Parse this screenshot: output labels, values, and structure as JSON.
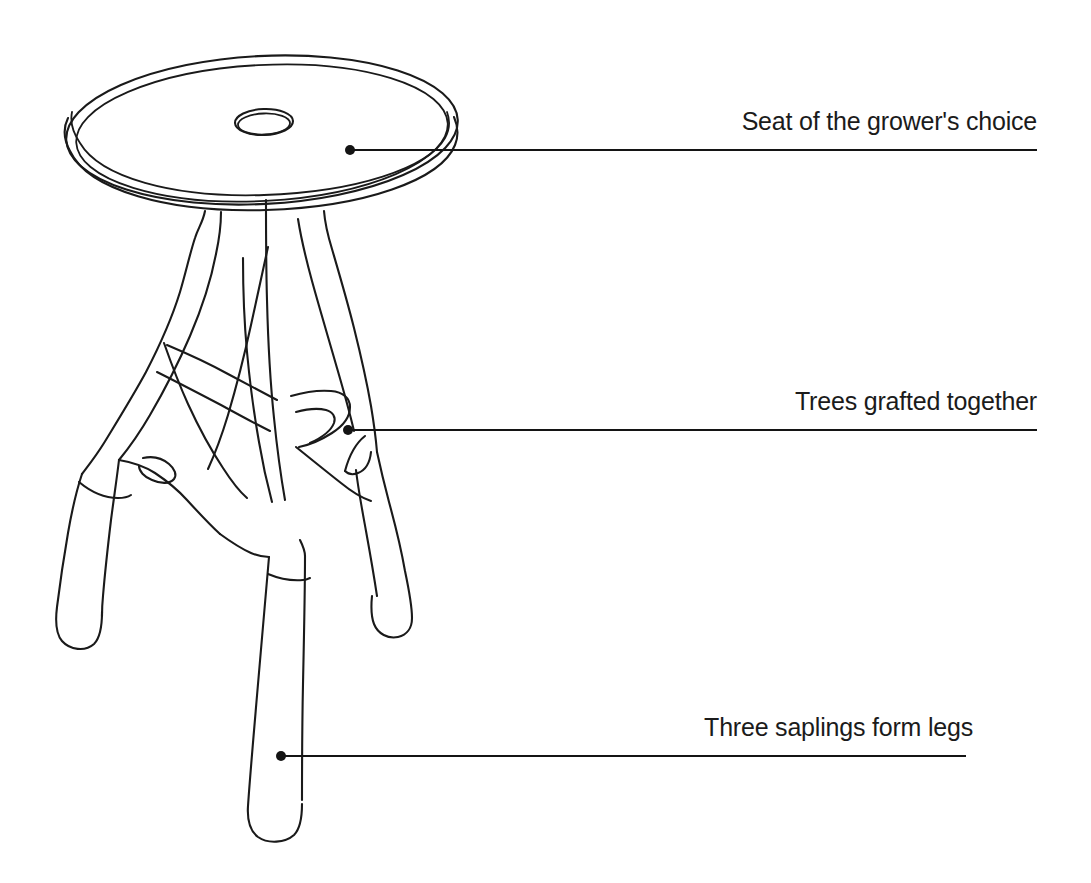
{
  "figure": {
    "background_color": "#ffffff",
    "ink_color": "#1a1a1a",
    "width": 1091,
    "height": 883
  },
  "callouts": [
    {
      "id": "seat",
      "label": "Seat of the grower's choice",
      "dot": {
        "x": 350,
        "y": 150
      },
      "line_end": {
        "x": 1037,
        "y": 150
      },
      "underline_y": 150
    },
    {
      "id": "graft",
      "label": "Trees grafted together",
      "dot": {
        "x": 348,
        "y": 430
      },
      "line_end": {
        "x": 1037,
        "y": 430
      },
      "underline_y": 430
    },
    {
      "id": "legs",
      "label": "Three saplings form legs",
      "dot": {
        "x": 281,
        "y": 756
      },
      "line_end": {
        "x": 966,
        "y": 756
      },
      "underline_y": 756
    }
  ],
  "parts": {
    "seat": {
      "name": "round seat disc",
      "center": {
        "x": 262,
        "y": 130
      },
      "radius_x": 196,
      "radius_y": 76,
      "hole": {
        "cx": 264,
        "cy": 122,
        "rx": 29,
        "ry": 13
      }
    },
    "trunk": {
      "name": "grafted trunk column"
    },
    "legs": [
      {
        "name": "left leg",
        "foot_y": 645
      },
      {
        "name": "front leg",
        "foot_y": 840
      },
      {
        "name": "right leg",
        "foot_y": 633
      }
    ]
  }
}
